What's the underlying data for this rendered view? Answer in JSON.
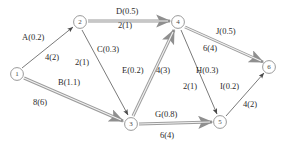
{
  "diagram": {
    "type": "directed-graph",
    "node_label_prefix": "",
    "nodes": [
      {
        "id": "1",
        "label": "1",
        "x": 17,
        "y": 74
      },
      {
        "id": "2",
        "label": "2",
        "x": 80,
        "y": 22
      },
      {
        "id": "3",
        "label": "3",
        "x": 131,
        "y": 124
      },
      {
        "id": "4",
        "label": "4",
        "x": 178,
        "y": 22
      },
      {
        "id": "5",
        "label": "5",
        "x": 220,
        "y": 122
      },
      {
        "id": "6",
        "label": "6",
        "x": 269,
        "y": 67
      }
    ],
    "edges": [
      {
        "name": "A",
        "from": "1",
        "to": "2",
        "activity": "A(0.2)",
        "weight": "4(2)",
        "highlighted": false
      },
      {
        "name": "B",
        "from": "1",
        "to": "3",
        "activity": "B(1.1)",
        "weight": "8(6)",
        "highlighted": true
      },
      {
        "name": "C",
        "from": "2",
        "to": "3",
        "activity": "C(0.3)",
        "weight": "2(1)",
        "highlighted": false
      },
      {
        "name": "D",
        "from": "2",
        "to": "4",
        "activity": "D(0.5)",
        "weight": "2(1)",
        "highlighted": true
      },
      {
        "name": "E",
        "from": "3",
        "to": "4",
        "activity": "E(0.2)",
        "weight": "4(3)",
        "highlighted": true
      },
      {
        "name": "G",
        "from": "3",
        "to": "5",
        "activity": "G(0.8)",
        "weight": "6(4)",
        "highlighted": true
      },
      {
        "name": "H",
        "from": "4",
        "to": "5",
        "activity": "H(0.3)",
        "weight": "2(1)",
        "highlighted": false
      },
      {
        "name": "I",
        "from": "5",
        "to": "6",
        "activity": "I(0.2)",
        "weight": "4(2)",
        "highlighted": false
      },
      {
        "name": "J",
        "from": "4",
        "to": "6",
        "activity": "J(0.5)",
        "weight": "6(4)",
        "highlighted": true
      }
    ],
    "labels": [
      {
        "key": "A_activity",
        "text": "A(0.2)",
        "x": 22,
        "y": 33
      },
      {
        "key": "A_weight",
        "text": "4(2)",
        "x": 45,
        "y": 53
      },
      {
        "key": "B_activity",
        "text": "B(1.1)",
        "x": 58,
        "y": 78
      },
      {
        "key": "B_weight",
        "text": "8(6)",
        "x": 33,
        "y": 98
      },
      {
        "key": "C_activity",
        "text": "C(0.3)",
        "x": 97,
        "y": 45
      },
      {
        "key": "C_weight",
        "text": "2(1)",
        "x": 75,
        "y": 58
      },
      {
        "key": "D_activity",
        "text": "D(0.5)",
        "x": 116,
        "y": 7
      },
      {
        "key": "D_weight",
        "text": "2(1)",
        "x": 118,
        "y": 21
      },
      {
        "key": "E_activity",
        "text": "E(0.2)",
        "x": 122,
        "y": 66
      },
      {
        "key": "E_weight",
        "text": "4(3)",
        "x": 156,
        "y": 66
      },
      {
        "key": "G_activity",
        "text": "G(0.8)",
        "x": 155,
        "y": 110
      },
      {
        "key": "G_weight",
        "text": "6(4)",
        "x": 160,
        "y": 131
      },
      {
        "key": "H_activity",
        "text": "H(0.3)",
        "x": 196,
        "y": 66
      },
      {
        "key": "H_weight",
        "text": "2(1)",
        "x": 183,
        "y": 82
      },
      {
        "key": "I_activity",
        "text": "I(0.2)",
        "x": 220,
        "y": 82
      },
      {
        "key": "I_weight",
        "text": "4(2)",
        "x": 243,
        "y": 100
      },
      {
        "key": "J_activity",
        "text": "J(0.5)",
        "x": 216,
        "y": 27
      },
      {
        "key": "J_weight",
        "text": "6(4)",
        "x": 203,
        "y": 44
      }
    ],
    "colors": {
      "background": "#ffffff",
      "node_stroke": "#9a9a9a",
      "edge_thin": "#6b6b6b",
      "edge_highlight": "#9c9c9c",
      "text": "#2b2b2b"
    }
  }
}
